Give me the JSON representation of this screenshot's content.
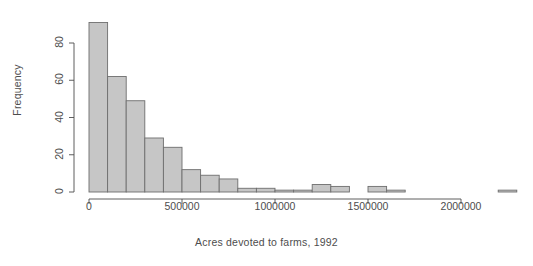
{
  "chart_data": {
    "type": "bar",
    "subtype": "histogram",
    "title": "",
    "xlabel": "Acres devoted to farms, 1992",
    "ylabel": "Frequency",
    "xlim": [
      -40000,
      2300000
    ],
    "ylim": [
      0,
      95
    ],
    "grid": false,
    "legend": null,
    "bin_width": 100000,
    "bin_edges": [
      0,
      100000,
      200000,
      300000,
      400000,
      500000,
      600000,
      700000,
      800000,
      900000,
      1000000,
      1100000,
      1200000,
      1300000,
      1400000,
      1500000,
      1600000,
      1700000,
      1800000,
      1900000,
      2000000,
      2100000,
      2200000,
      2300000
    ],
    "categories": [
      "0-100000",
      "100000-200000",
      "200000-300000",
      "300000-400000",
      "400000-500000",
      "500000-600000",
      "600000-700000",
      "700000-800000",
      "800000-900000",
      "900000-1000000",
      "1000000-1100000",
      "1100000-1200000",
      "1200000-1300000",
      "1300000-1400000",
      "1400000-1500000",
      "1500000-1600000",
      "1600000-1700000",
      "1700000-1800000",
      "1800000-1900000",
      "1900000-2000000",
      "2000000-2100000",
      "2100000-2200000",
      "2200000-2300000"
    ],
    "values": [
      91,
      62,
      49,
      29,
      24,
      12,
      9,
      7,
      2,
      2,
      1,
      1,
      4,
      3,
      0,
      3,
      1,
      0,
      0,
      0,
      0,
      0,
      1
    ],
    "xticks": [
      0,
      500000,
      1000000,
      1500000,
      2000000
    ],
    "xtick_labels": [
      "0",
      "500000",
      "1000000",
      "1500000",
      "2000000"
    ],
    "yticks": [
      0,
      20,
      40,
      60,
      80
    ],
    "ytick_labels": [
      "0",
      "20",
      "40",
      "60",
      "80"
    ],
    "bar_fill_color": "#c6c6c6",
    "bar_border_color": "#6e6e6e",
    "axis_color": "#4d4d4d",
    "text_color": "#4d4d4d",
    "background_color": "#ffffff"
  }
}
